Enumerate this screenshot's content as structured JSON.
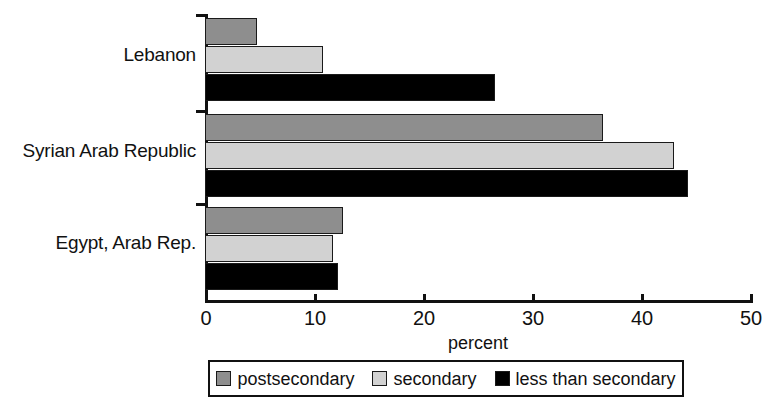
{
  "chart_data": {
    "type": "bar",
    "orientation": "horizontal",
    "title": "",
    "subtitle": "",
    "xlabel": "percent",
    "ylabel": "",
    "xlim": [
      0,
      50
    ],
    "xticks": [
      0,
      10,
      20,
      30,
      40,
      50
    ],
    "xtick_labels": [
      "0",
      "10",
      "20",
      "30",
      "40",
      "50"
    ],
    "grid": false,
    "legend_position": "bottom",
    "categories": [
      "Lebanon",
      "Syrian Arab Republic",
      "Egypt, Arab Rep."
    ],
    "series": [
      {
        "name": "postsecondary",
        "color": "#8e8e8e",
        "values": [
          4.8,
          36.5,
          12.7
        ]
      },
      {
        "name": "secondary",
        "color": "#d2d2d2",
        "values": [
          10.8,
          43.0,
          11.7
        ]
      },
      {
        "name": "less than secondary",
        "color": "#000000",
        "values": [
          26.6,
          44.3,
          12.2
        ]
      }
    ]
  },
  "axis": {
    "x_title": "percent",
    "tick_labels": [
      "0",
      "10",
      "20",
      "30",
      "40",
      "50"
    ]
  },
  "legend": {
    "items": [
      {
        "label": "postsecondary",
        "color": "#8e8e8e"
      },
      {
        "label": "secondary",
        "color": "#d2d2d2"
      },
      {
        "label": "less than secondary",
        "color": "#000000"
      }
    ]
  },
  "categories": {
    "labels": [
      "Lebanon",
      "Syrian Arab Republic",
      "Egypt, Arab Rep."
    ]
  }
}
